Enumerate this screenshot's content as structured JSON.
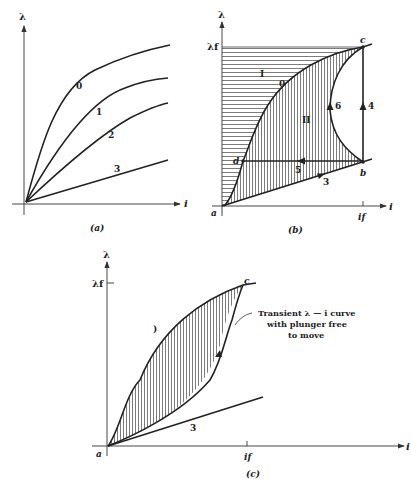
{
  "figure": {
    "panels": [
      {
        "id": "a",
        "caption": "(a)",
        "y_axis_label": "λ",
        "x_axis_label": "i",
        "curve_labels": [
          "0",
          "1",
          "2",
          "3"
        ]
      },
      {
        "id": "b",
        "caption": "(b)",
        "y_axis_label": "λ",
        "y_tick_label": "λf",
        "x_axis_label": "i",
        "x_tick_label": "if",
        "point_labels": {
          "a": "a",
          "b": "b",
          "c": "c",
          "d": "d"
        },
        "region_labels": [
          "I",
          "II"
        ],
        "curve_labels": {
          "curve0": "0",
          "path3": "3",
          "path4": "4",
          "path5": "5",
          "path6": "6"
        }
      },
      {
        "id": "c",
        "caption": "(c)",
        "y_axis_label": "λ",
        "y_tick_label": "λf",
        "x_axis_label": "i",
        "x_tick_label": "if",
        "point_labels": {
          "a": "a",
          "c": "c"
        },
        "curve_labels": {
          "curve0": ")",
          "line3": "3"
        },
        "annotation": [
          "Transient λ — i curve",
          "with plunger free",
          "to move"
        ]
      }
    ]
  }
}
